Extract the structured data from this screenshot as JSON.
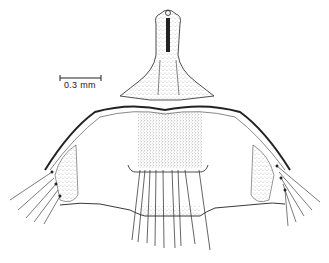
{
  "figure": {
    "type": "scientific line drawing (stippled anatomical illustration)",
    "scale_bar": {
      "label": "0.3 mm"
    },
    "colors": {
      "ink": "#222222",
      "background": "#ffffff"
    }
  }
}
